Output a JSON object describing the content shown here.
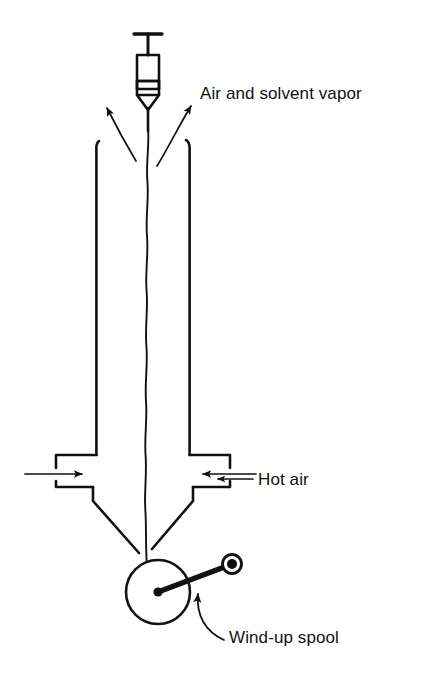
{
  "figure": {
    "background_color": "#ffffff",
    "line_color": "#111111",
    "width": 429,
    "height": 684
  },
  "labels": {
    "air_and_solvent_vapor": "Air and solvent vapor",
    "hot_air": "Hot air",
    "wind_up_spool": "Wind-up spool"
  },
  "parts": {
    "syringe": "syringe-spinneret",
    "column": "drying-column",
    "inlet_left": "hot-air-inlet-left",
    "inlet_right": "hot-air-inlet-right",
    "funnel": "collection-funnel",
    "spool": "wind-up-spool",
    "crank": "spool-crank-handle",
    "filament": "polymer-filament"
  },
  "arrows": {
    "vapor_left": "vapor-arrow-left",
    "vapor_right": "vapor-arrow-right",
    "hot_air_inlet_left": "hot-air-arrow-left",
    "hot_air_inlet_right": "hot-air-arrow-right",
    "hot_air_pointer": "hot-air-label-arrow",
    "spool_pointer": "wind-up-spool-label-arrow"
  }
}
